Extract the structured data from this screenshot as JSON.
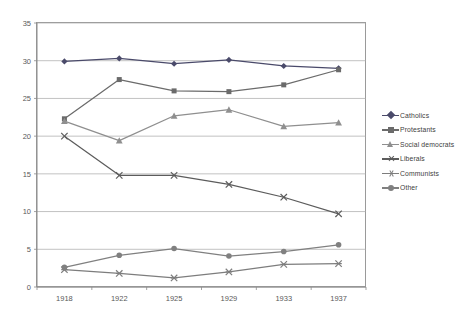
{
  "chart_data": {
    "type": "line",
    "title": "",
    "subtitle": "",
    "xlabel": "",
    "ylabel": "",
    "categories": [
      "1918",
      "1922",
      "1925",
      "1929",
      "1933",
      "1937"
    ],
    "x": [
      1918,
      1922,
      1925,
      1929,
      1933,
      1937
    ],
    "ylim": [
      0,
      35
    ],
    "yticks": [
      0,
      5,
      10,
      15,
      20,
      25,
      30,
      35
    ],
    "ytick_labels": [
      "0",
      "5",
      "10",
      "15",
      "20",
      "25",
      "30",
      "35"
    ],
    "grid": "horizontal",
    "legend_position": "right",
    "series": [
      {
        "name": "Catholics",
        "marker": "diamond",
        "color": "#4a4a6a",
        "values": [
          29.9,
          30.3,
          29.6,
          30.1,
          29.3,
          29.0
        ]
      },
      {
        "name": "Protestants",
        "marker": "square",
        "color": "#6b6b6b",
        "values": [
          22.3,
          27.5,
          26.0,
          25.9,
          26.8,
          28.8
        ]
      },
      {
        "name": "Social democrats",
        "marker": "triangle",
        "color": "#8f8f8f",
        "values": [
          22.0,
          19.4,
          22.7,
          23.5,
          21.3,
          21.8
        ]
      },
      {
        "name": "Liberals",
        "marker": "x",
        "color": "#5c5c5c",
        "values": [
          20.0,
          14.8,
          14.8,
          13.6,
          11.9,
          9.7
        ]
      },
      {
        "name": "Communists",
        "marker": "star",
        "color": "#7d7d7d",
        "values": [
          2.3,
          1.8,
          1.2,
          2.0,
          3.0,
          3.1
        ]
      },
      {
        "name": "Other",
        "marker": "circle",
        "color": "#808080",
        "values": [
          2.6,
          4.2,
          5.1,
          4.1,
          4.7,
          5.6
        ]
      }
    ]
  },
  "legend": {
    "items": [
      {
        "label": "Catholics"
      },
      {
        "label": "Protestants"
      },
      {
        "label": "Social democrats"
      },
      {
        "label": "Liberals"
      },
      {
        "label": "Communists"
      },
      {
        "label": "Other"
      }
    ]
  },
  "axes": {
    "y_labels": [
      "35",
      "30",
      "25",
      "20",
      "15",
      "10",
      "5",
      "0"
    ],
    "x_labels": [
      "1918",
      "1922",
      "1925",
      "1929",
      "1933",
      "1937"
    ]
  }
}
